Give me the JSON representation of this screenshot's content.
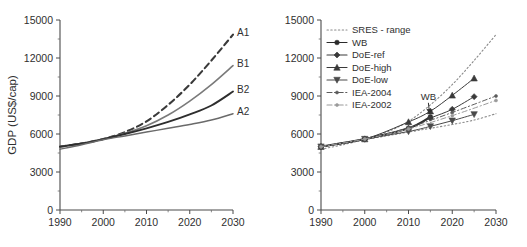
{
  "figure": {
    "background_color": "#ffffff",
    "panel_count": 2
  },
  "chart_data": [
    {
      "type": "line",
      "panel": "left",
      "title": "",
      "xlabel": "",
      "ylabel": "GDP (US$/cap)",
      "xlim": [
        1990,
        2030
      ],
      "ylim": [
        0,
        15000
      ],
      "xticks": [
        1990,
        2000,
        2010,
        2020,
        2030
      ],
      "xtick_labels": [
        "1990",
        "2000",
        "2010",
        "2020",
        "2030"
      ],
      "yticks": [
        0,
        3000,
        6000,
        9000,
        12000,
        15000
      ],
      "ytick_labels": [
        "0",
        "3000",
        "6000",
        "9000",
        "12000",
        "15000"
      ],
      "x_minor_ticks": [
        1995,
        2005,
        2015,
        2025
      ],
      "y_minor_ticks": [
        1500,
        4500,
        7500,
        10500,
        13500
      ],
      "grid": false,
      "legend": "inline-end-labels",
      "x": [
        1990,
        1995,
        2000,
        2005,
        2010,
        2015,
        2020,
        2025,
        2030
      ],
      "series": [
        {
          "name": "A1",
          "label": "A1",
          "color": "#3a3a3a",
          "style": "dashed",
          "width": 2.1,
          "values": [
            5000,
            5250,
            5600,
            6150,
            7000,
            8300,
            9900,
            11800,
            13850
          ]
        },
        {
          "name": "B1",
          "label": "B1",
          "color": "#7a7a7a",
          "style": "solid",
          "width": 1.6,
          "values": [
            5000,
            5250,
            5600,
            6050,
            6650,
            7500,
            8600,
            9900,
            11400
          ]
        },
        {
          "name": "B2",
          "label": "B2",
          "color": "#2e2e2e",
          "style": "solid",
          "width": 1.9,
          "values": [
            5000,
            5250,
            5600,
            6000,
            6450,
            6950,
            7550,
            8250,
            9350
          ]
        },
        {
          "name": "A2",
          "label": "A2",
          "color": "#6a6a6a",
          "style": "solid",
          "width": 1.5,
          "values": [
            4800,
            5150,
            5550,
            5850,
            6150,
            6450,
            6750,
            7100,
            7600
          ]
        }
      ]
    },
    {
      "type": "line",
      "panel": "right",
      "title": "",
      "xlabel": "",
      "ylabel": "",
      "xlim": [
        1990,
        2030
      ],
      "ylim": [
        0,
        15000
      ],
      "xticks": [
        1990,
        2000,
        2010,
        2020,
        2030
      ],
      "xtick_labels": [
        "1990",
        "2000",
        "2010",
        "2020",
        "2030"
      ],
      "yticks": [
        0,
        3000,
        6000,
        9000,
        12000,
        15000
      ],
      "ytick_labels": [
        "0",
        "3000",
        "6000",
        "9000",
        "12000",
        "15000"
      ],
      "x_minor_ticks": [
        1995,
        2005,
        2015,
        2025
      ],
      "y_minor_ticks": [
        1500,
        4500,
        7500,
        10500,
        13500
      ],
      "grid": false,
      "legend": "upper-left-inside",
      "annotations": [
        {
          "text": "WB",
          "x": 2015,
          "y": 8700,
          "points_to_x": 2015,
          "points_to_y": 7350
        }
      ],
      "x": [
        1990,
        1995,
        2000,
        2005,
        2010,
        2015,
        2020,
        2025,
        2030
      ],
      "series": [
        {
          "name": "SRES - range",
          "label": "SRES - range",
          "color": "#8a8a8a",
          "style": "dotted",
          "marker": "none",
          "width": 1.1,
          "bound": "upper",
          "values": [
            5000,
            5250,
            5600,
            6150,
            7000,
            8300,
            9900,
            11800,
            13850
          ]
        },
        {
          "name": "SRES - range lower",
          "label": "SRES - range",
          "color": "#8a8a8a",
          "style": "dotted",
          "marker": "none",
          "width": 1.1,
          "bound": "lower",
          "values": [
            4800,
            5150,
            5550,
            5850,
            6150,
            6450,
            6750,
            7100,
            7600
          ]
        },
        {
          "name": "WB",
          "label": "WB",
          "color": "#2b2b2b",
          "style": "solid",
          "marker": "circle",
          "width": 2.0,
          "x": [
            1990,
            2000,
            2010,
            2015
          ],
          "values": [
            5000,
            5600,
            6450,
            7350
          ]
        },
        {
          "name": "DoE-ref",
          "label": "DoE-ref",
          "color": "#3a3a3a",
          "style": "solid",
          "marker": "diamond",
          "width": 1.0,
          "x": [
            1990,
            2000,
            2010,
            2015,
            2020,
            2025
          ],
          "values": [
            5000,
            5600,
            6450,
            7250,
            7950,
            8950
          ]
        },
        {
          "name": "DoE-high",
          "label": "DoE-high",
          "color": "#3a3a3a",
          "style": "solid",
          "marker": "triangle-up",
          "width": 1.0,
          "x": [
            1990,
            2000,
            2010,
            2015,
            2020,
            2025
          ],
          "values": [
            5000,
            5600,
            6950,
            7800,
            9050,
            10400
          ]
        },
        {
          "name": "DoE-low",
          "label": "DoE-low",
          "color": "#4a4a4a",
          "style": "solid",
          "marker": "triangle-down",
          "width": 1.0,
          "x": [
            1990,
            2000,
            2010,
            2015,
            2020,
            2025
          ],
          "values": [
            5000,
            5600,
            6200,
            6600,
            7050,
            7550
          ]
        },
        {
          "name": "IEA-2004",
          "label": "IEA-2004",
          "color": "#5c5c5c",
          "style": "dash-dot",
          "marker": "dot",
          "width": 1.0,
          "x": [
            1990,
            2000,
            2010,
            2020,
            2030
          ],
          "values": [
            5000,
            5600,
            6500,
            7700,
            9000
          ]
        },
        {
          "name": "IEA-2002",
          "label": "IEA-2002",
          "color": "#9a9a9a",
          "style": "dash-dot",
          "marker": "dot",
          "width": 1.0,
          "x": [
            1990,
            2000,
            2010,
            2020,
            2030
          ],
          "values": [
            5000,
            5600,
            6400,
            7450,
            8650
          ]
        }
      ],
      "legend_entries": [
        {
          "label": "SRES - range",
          "style": "dotted",
          "marker": "none",
          "color": "#8a8a8a"
        },
        {
          "label": "WB",
          "style": "solid",
          "marker": "circle",
          "color": "#2b2b2b"
        },
        {
          "label": "DoE-ref",
          "style": "solid",
          "marker": "diamond",
          "color": "#3a3a3a"
        },
        {
          "label": "DoE-high",
          "style": "solid",
          "marker": "triangle-up",
          "color": "#3a3a3a"
        },
        {
          "label": "DoE-low",
          "style": "solid",
          "marker": "triangle-down",
          "color": "#4a4a4a"
        },
        {
          "label": "IEA-2004",
          "style": "dash-dot",
          "marker": "dot",
          "color": "#5c5c5c"
        },
        {
          "label": "IEA-2002",
          "style": "dash-dot",
          "marker": "dot",
          "color": "#9a9a9a"
        }
      ]
    }
  ]
}
